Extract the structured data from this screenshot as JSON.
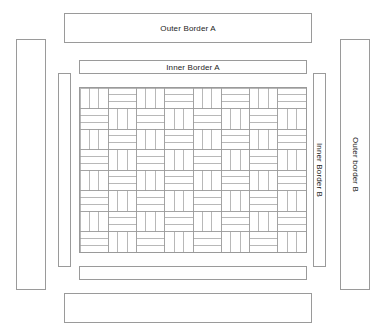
{
  "diagram": {
    "background_color": "#ffffff",
    "line_color": "#9a9a9a",
    "text_color": "#1c1c1c"
  },
  "borders": {
    "outer_top": {
      "label": "Outer Border A",
      "orientation": "horizontal",
      "x": 64,
      "y": 13,
      "w": 248,
      "h": 30
    },
    "outer_bottom": {
      "label": "",
      "orientation": "horizontal",
      "x": 64,
      "y": 293,
      "w": 248,
      "h": 30
    },
    "outer_left": {
      "label": "",
      "orientation": "vertical",
      "x": 16,
      "y": 39,
      "w": 30,
      "h": 251
    },
    "outer_right": {
      "label": "Outer border B",
      "orientation": "vertical",
      "x": 340,
      "y": 39,
      "w": 30,
      "h": 251
    },
    "inner_top": {
      "label": "Inner Border A",
      "orientation": "horizontal",
      "x": 79,
      "y": 60,
      "w": 228,
      "h": 14
    },
    "inner_bottom": {
      "label": "",
      "orientation": "horizontal",
      "x": 79,
      "y": 266,
      "w": 228,
      "h": 14
    },
    "inner_left": {
      "label": "",
      "orientation": "vertical",
      "x": 58,
      "y": 73,
      "w": 13,
      "h": 194
    },
    "inner_right": {
      "label": "Inner Border B",
      "orientation": "vertical",
      "x": 313,
      "y": 73,
      "w": 13,
      "h": 194
    }
  },
  "quilt_center": {
    "name": "basketweave-quilt-center",
    "x": 79,
    "y": 87,
    "w": 228,
    "h": 166,
    "units_across": 8,
    "units_down": 8,
    "strips_per_unit": 3,
    "pattern": "basketweave"
  }
}
